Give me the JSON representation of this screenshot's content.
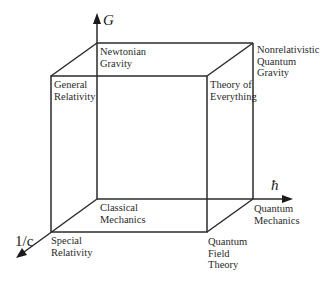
{
  "diagram": {
    "type": "cube of physical theories",
    "line_color": "#2b2b2b",
    "axes": {
      "vertical": {
        "label": "G"
      },
      "horizontal": {
        "label": "ħ"
      },
      "depth": {
        "label": "1/c"
      }
    },
    "vertices": {
      "origin": "Classical\nMechanics",
      "g": "Newtonian\nGravity",
      "hbar": "Quantum\nMechanics",
      "c": "Special\nRelativity",
      "g_hbar": "Nonrelativistic\nQuantum\nGravity",
      "g_c": "General\nRelativity",
      "hbar_c": "Quantum\nField\nTheory",
      "g_hbar_c": "Theory of\nEverything"
    }
  }
}
